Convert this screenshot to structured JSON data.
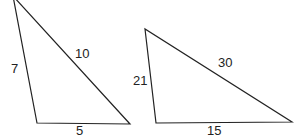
{
  "figure": {
    "type": "similar-triangles-diagram",
    "background_color": "#ffffff",
    "stroke_color": "#222222",
    "text_color": "#222222"
  },
  "triangles": [
    {
      "id": "left-triangle",
      "name": "small-triangle",
      "apex_clipped_at_top": true,
      "vertices": [
        {
          "name": "apex",
          "x": 13,
          "y": -4
        },
        {
          "name": "bottom-left",
          "x": 37,
          "y": 123
        },
        {
          "name": "bottom-right",
          "x": 130,
          "y": 124
        }
      ],
      "sides": [
        {
          "name": "left-side",
          "label": "7",
          "label_x": 11,
          "label_y": 62
        },
        {
          "name": "hypotenuse",
          "label": "10",
          "label_x": 75,
          "label_y": 47
        },
        {
          "name": "base",
          "label": "5",
          "label_x": 76,
          "label_y": 124
        }
      ]
    },
    {
      "id": "right-triangle",
      "name": "large-triangle",
      "apex_clipped_at_top": false,
      "vertices": [
        {
          "name": "apex",
          "x": 145,
          "y": 29
        },
        {
          "name": "bottom-left",
          "x": 156,
          "y": 123
        },
        {
          "name": "bottom-right",
          "x": 292,
          "y": 122
        }
      ],
      "sides": [
        {
          "name": "left-side",
          "label": "21",
          "label_x": 133,
          "label_y": 74
        },
        {
          "name": "hypotenuse",
          "label": "30",
          "label_x": 218,
          "label_y": 56
        },
        {
          "name": "base",
          "label": "15",
          "label_x": 207,
          "label_y": 124
        }
      ]
    }
  ],
  "labels": {
    "left_side_small": "7",
    "hypotenuse_small": "10",
    "base_small": "5",
    "left_side_large": "21",
    "hypotenuse_large": "30",
    "base_large": "15"
  }
}
